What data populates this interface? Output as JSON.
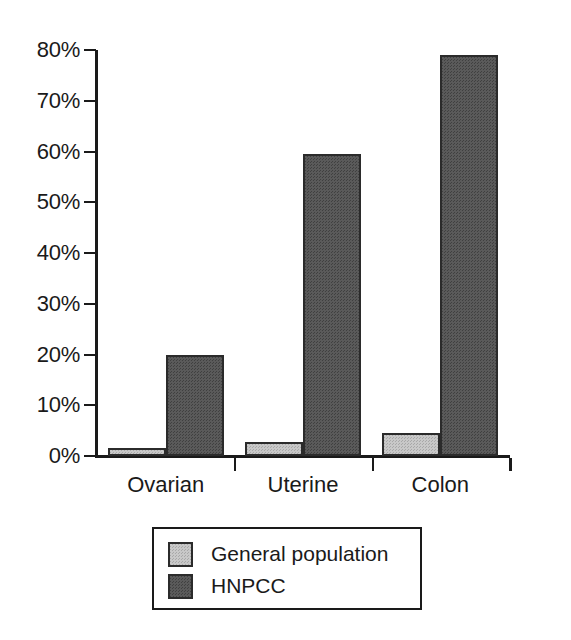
{
  "chart_data": {
    "type": "bar",
    "title": "",
    "subtitle": "",
    "xlabel": "",
    "ylabel": "",
    "categories": [
      "Ovarian",
      "Uterine",
      "Colon"
    ],
    "series": [
      {
        "name": "General population",
        "color": "#c8c8c8",
        "values": [
          1.5,
          2.7,
          4.5
        ]
      },
      {
        "name": "HNPCC",
        "color": "#5a5a5a",
        "values": [
          20,
          59.5,
          79
        ]
      }
    ],
    "ylim": [
      0,
      80
    ],
    "ytick_values": [
      0,
      10,
      20,
      30,
      40,
      50,
      60,
      70,
      80
    ],
    "ytick_labels": [
      "0%",
      "10%",
      "20%",
      "30%",
      "40%",
      "50%",
      "60%",
      "70%",
      "80%"
    ],
    "grid": false,
    "legend_position": "bottom-center",
    "value_format": "percent"
  },
  "legend": {
    "entries": [
      {
        "label": "General population"
      },
      {
        "label": "HNPCC"
      }
    ]
  }
}
